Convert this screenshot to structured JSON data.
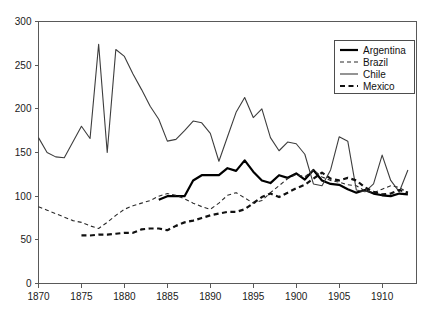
{
  "chart_data": {
    "type": "line",
    "title": "",
    "subtitle": "",
    "xlabel": "",
    "ylabel": "",
    "xlim": [
      1870,
      1914
    ],
    "ylim": [
      0,
      300
    ],
    "grid": false,
    "legend_position": "top-right",
    "x_ticks": [
      1870,
      1875,
      1880,
      1885,
      1890,
      1895,
      1900,
      1905,
      1910
    ],
    "y_ticks": [
      0,
      50,
      100,
      150,
      200,
      250,
      300
    ],
    "x_tick_labels": [
      "1870",
      "1875",
      "1880",
      "1885",
      "1890",
      "1895",
      "1900",
      "1905",
      "1910"
    ],
    "y_tick_labels": [
      "0",
      "50",
      "100",
      "150",
      "200",
      "250",
      "300"
    ],
    "series": [
      {
        "name": "Argentina",
        "color": "#000000",
        "style": "solid",
        "width": 2.2,
        "x": [
          1884,
          1885,
          1886,
          1887,
          1888,
          1889,
          1890,
          1891,
          1892,
          1893,
          1894,
          1895,
          1896,
          1897,
          1898,
          1899,
          1900,
          1901,
          1902,
          1903,
          1904,
          1905,
          1906,
          1907,
          1908,
          1909,
          1910,
          1911,
          1912,
          1913
        ],
        "values": [
          96,
          100,
          100,
          100,
          118,
          124,
          124,
          124,
          132,
          129,
          141,
          128,
          118,
          115,
          124,
          121,
          126,
          119,
          130,
          118,
          114,
          113,
          108,
          104,
          107,
          103,
          101,
          100,
          103,
          102
        ]
      },
      {
        "name": "Brazil",
        "color": "#2b2b2b",
        "style": "dashed-thin",
        "width": 1.1,
        "x": [
          1870,
          1871,
          1872,
          1873,
          1874,
          1875,
          1876,
          1877,
          1878,
          1879,
          1880,
          1881,
          1882,
          1883,
          1884,
          1885,
          1886,
          1887,
          1888,
          1889,
          1890,
          1891,
          1892,
          1893,
          1894,
          1895,
          1896,
          1897,
          1898,
          1899,
          1900,
          1901,
          1902,
          1903,
          1904,
          1905,
          1906,
          1907,
          1908,
          1909,
          1910,
          1911,
          1912,
          1913
        ],
        "values": [
          88,
          84,
          80,
          76,
          72,
          70,
          66,
          63,
          70,
          78,
          85,
          89,
          92,
          95,
          100,
          103,
          101,
          97,
          92,
          88,
          85,
          92,
          101,
          104,
          98,
          92,
          95,
          104,
          112,
          120,
          125,
          122,
          130,
          122,
          118,
          116,
          113,
          112,
          106,
          104,
          108,
          112,
          110,
          104
        ]
      },
      {
        "name": "Chile",
        "color": "#3d3d3d",
        "style": "solid-thin",
        "width": 1.1,
        "x": [
          1870,
          1871,
          1872,
          1873,
          1874,
          1875,
          1876,
          1877,
          1878,
          1879,
          1880,
          1881,
          1882,
          1883,
          1884,
          1885,
          1886,
          1887,
          1888,
          1889,
          1890,
          1891,
          1892,
          1893,
          1894,
          1895,
          1896,
          1897,
          1898,
          1899,
          1900,
          1901,
          1902,
          1903,
          1904,
          1905,
          1906,
          1907,
          1908,
          1909,
          1910,
          1911,
          1912,
          1913
        ],
        "values": [
          167,
          150,
          145,
          144,
          162,
          180,
          166,
          274,
          150,
          268,
          260,
          240,
          222,
          203,
          188,
          163,
          165,
          175,
          186,
          184,
          172,
          140,
          168,
          196,
          213,
          190,
          200,
          167,
          152,
          162,
          160,
          148,
          114,
          112,
          130,
          168,
          163,
          107,
          105,
          114,
          147,
          118,
          105,
          130
        ]
      },
      {
        "name": "Mexico",
        "color": "#111111",
        "style": "dashed-thick",
        "width": 2.2,
        "x": [
          1875,
          1876,
          1877,
          1878,
          1879,
          1880,
          1881,
          1882,
          1883,
          1884,
          1885,
          1886,
          1887,
          1888,
          1889,
          1890,
          1891,
          1892,
          1893,
          1894,
          1895,
          1896,
          1897,
          1898,
          1899,
          1900,
          1901,
          1902,
          1903,
          1904,
          1905,
          1906,
          1907,
          1908,
          1909,
          1910,
          1911,
          1912,
          1913
        ],
        "values": [
          55,
          55,
          56,
          56,
          57,
          58,
          58,
          62,
          63,
          63,
          61,
          66,
          70,
          72,
          75,
          78,
          80,
          82,
          82,
          85,
          92,
          99,
          103,
          99,
          104,
          109,
          113,
          120,
          127,
          120,
          118,
          121,
          118,
          110,
          105,
          102,
          103,
          107,
          104
        ]
      }
    ]
  },
  "legend": {
    "items": [
      {
        "label": "Argentina",
        "style": "solid"
      },
      {
        "label": "Brazil",
        "style": "dashed-thin"
      },
      {
        "label": "Chile",
        "style": "solid-thin"
      },
      {
        "label": "Mexico",
        "style": "dashed-thick"
      }
    ]
  }
}
